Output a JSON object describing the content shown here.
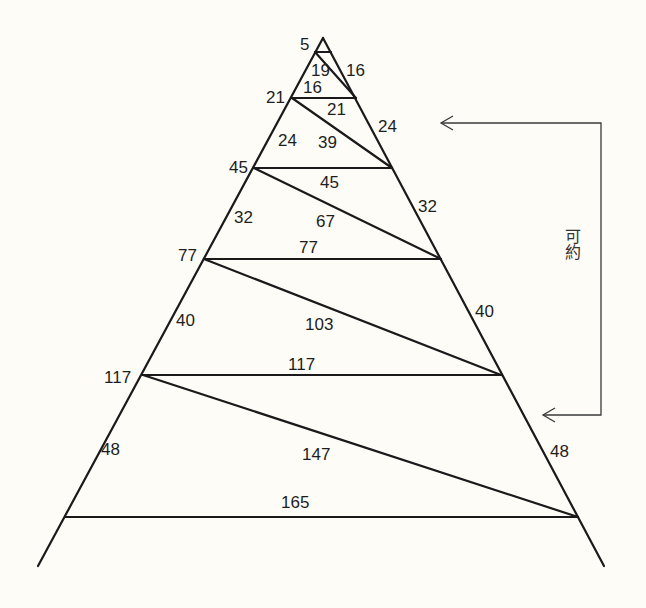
{
  "diagram": {
    "apex_label": "5",
    "left_labels": [
      "21",
      "45",
      "77",
      "117"
    ],
    "left_side_labels": [
      "24",
      "32",
      "40",
      "48"
    ],
    "right_side_labels": [
      "16",
      "24",
      "32",
      "40",
      "48"
    ],
    "horizontal_labels": [
      "16",
      "45",
      "77",
      "117",
      "165"
    ],
    "diagonal_labels": [
      "19",
      "21",
      "39",
      "67",
      "103",
      "147"
    ],
    "bracket_label": "可約",
    "colors": {
      "line": "#1a1a1a",
      "background": "#fdfcf7",
      "bracket": "#3a3a3a"
    }
  }
}
